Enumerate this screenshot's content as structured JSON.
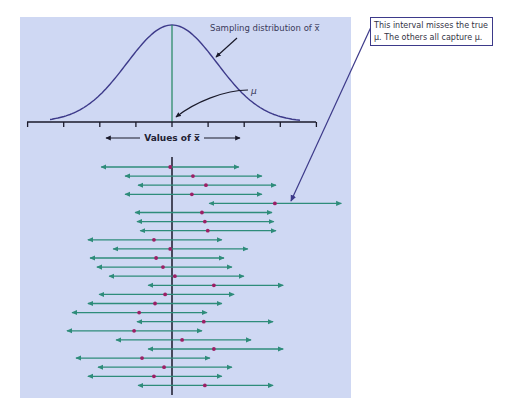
{
  "figure": {
    "distribution_label": "Sampling distribution of x̅",
    "mu_label": "μ",
    "axis_label": "Values of x̅",
    "callout": {
      "line1": "This interval misses the true",
      "line2": "μ. The others all capture μ."
    },
    "colors": {
      "panel_background": "#cfd8f3",
      "curve": "#3d3a8a",
      "mu_line_top": "#2e8c6a",
      "mu_line_bottom": "#1a1a2a",
      "interval": "#2e8c7a",
      "sample_mean": "#9c1f66",
      "callout_line": "#3d3a8a"
    },
    "axis_ticks_count": 9,
    "intervals_note": "Each interval: sample mean x̄ (dot) with left/right bounds, in units where μ = 0 and one tick = 1 unit",
    "intervals": [
      {
        "lo": -1.96,
        "mean": -0.05,
        "hi": 1.85,
        "captures": true
      },
      {
        "lo": -1.3,
        "mean": 0.58,
        "hi": 2.49,
        "captures": true
      },
      {
        "lo": -0.94,
        "mean": 0.94,
        "hi": 2.88,
        "captures": true
      },
      {
        "lo": -1.3,
        "mean": 0.55,
        "hi": 2.49,
        "captures": true
      },
      {
        "lo": 1.03,
        "mean": 2.85,
        "hi": 4.69,
        "captures": false
      },
      {
        "lo": -1.02,
        "mean": 0.83,
        "hi": 2.77,
        "captures": true
      },
      {
        "lo": -0.97,
        "mean": 0.91,
        "hi": 2.82,
        "captures": true
      },
      {
        "lo": -0.88,
        "mean": 0.99,
        "hi": 2.88,
        "captures": true
      },
      {
        "lo": -2.33,
        "mean": -0.5,
        "hi": 1.38,
        "captures": true
      },
      {
        "lo": -1.63,
        "mean": -0.05,
        "hi": 2.1,
        "captures": true
      },
      {
        "lo": -2.27,
        "mean": -0.44,
        "hi": 1.44,
        "captures": true
      },
      {
        "lo": -2.08,
        "mean": -0.25,
        "hi": 1.66,
        "captures": true
      },
      {
        "lo": -1.74,
        "mean": 0.08,
        "hi": 1.99,
        "captures": true
      },
      {
        "lo": -0.66,
        "mean": 1.16,
        "hi": 3.08,
        "captures": true
      },
      {
        "lo": -2.02,
        "mean": -0.19,
        "hi": 1.72,
        "captures": true
      },
      {
        "lo": -2.33,
        "mean": -0.47,
        "hi": 1.38,
        "captures": true
      },
      {
        "lo": -2.77,
        "mean": -0.91,
        "hi": 0.97,
        "captures": true
      },
      {
        "lo": -0.97,
        "mean": 0.88,
        "hi": 2.8,
        "captures": true
      },
      {
        "lo": -2.91,
        "mean": -1.05,
        "hi": 0.83,
        "captures": true
      },
      {
        "lo": -1.55,
        "mean": 0.28,
        "hi": 2.19,
        "captures": true
      },
      {
        "lo": -0.66,
        "mean": 1.16,
        "hi": 3.08,
        "captures": true
      },
      {
        "lo": -2.66,
        "mean": -0.83,
        "hi": 1.05,
        "captures": true
      },
      {
        "lo": -2.05,
        "mean": -0.22,
        "hi": 1.66,
        "captures": true
      },
      {
        "lo": -2.33,
        "mean": -0.5,
        "hi": 1.38,
        "captures": true
      },
      {
        "lo": -0.94,
        "mean": 0.91,
        "hi": 2.8,
        "captures": true
      }
    ]
  }
}
